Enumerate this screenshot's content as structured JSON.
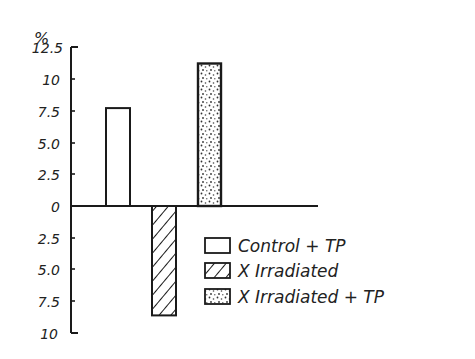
{
  "chart_data": {
    "type": "bar",
    "title": "",
    "xlabel": "",
    "ylabel": "%",
    "ylim": [
      -10,
      12.5
    ],
    "y_ticks": [
      12.5,
      10,
      7.5,
      5.0,
      2.5,
      0,
      -2.5,
      -5.0,
      -7.5,
      -10
    ],
    "y_tick_labels": [
      "12.5",
      "10",
      "7.5",
      "5.0",
      "2.5",
      "0",
      "2.5",
      "5.0",
      "7.5",
      "10"
    ],
    "grid": false,
    "legend_position": "lower right",
    "categories": [
      "Control + TP",
      "X Irradiated",
      "X Irradiated + TP"
    ],
    "values": [
      7.7,
      -8.6,
      11.2
    ],
    "series": [
      {
        "name": "Control + TP",
        "value": 7.7,
        "fill": "open"
      },
      {
        "name": "X Irradiated",
        "value": -8.6,
        "fill": "hatched"
      },
      {
        "name": "X Irradiated + TP",
        "value": 11.2,
        "fill": "stippled"
      }
    ]
  },
  "axis": {
    "unit_label": "%"
  },
  "legend": {
    "items": [
      {
        "label": "Control + TP",
        "pattern": "open"
      },
      {
        "label": "X Irradiated",
        "pattern": "hatched"
      },
      {
        "label": "X Irradiated + TP",
        "pattern": "stippled"
      }
    ]
  },
  "colors": {
    "ink": "#1a1a1a",
    "background": "#ffffff"
  }
}
